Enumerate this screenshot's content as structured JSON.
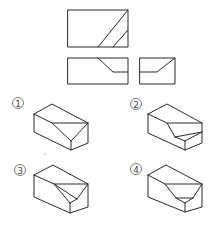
{
  "diagram": {
    "type": "orthographic-to-isometric-question",
    "views": {
      "top_view": "top-view",
      "front_view": "front-view",
      "side_view": "right-side-view"
    },
    "options": [
      {
        "number": "1",
        "label": "①"
      },
      {
        "number": "2",
        "label": "②"
      },
      {
        "number": "3",
        "label": "③"
      },
      {
        "number": "4",
        "label": "④"
      }
    ],
    "colors": {
      "line": "#2a2a2a",
      "background": "#ffffff"
    }
  }
}
